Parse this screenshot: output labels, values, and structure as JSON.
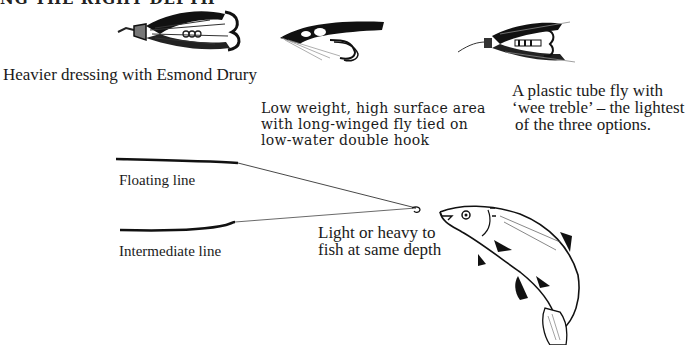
{
  "header": {
    "fragment": "NG THE RIGHT DEPTH"
  },
  "flies": [
    {
      "id": "heavy-dressing-fly",
      "caption": "Heavier dressing with Esmond Drury"
    },
    {
      "id": "long-winged-fly",
      "caption_lines": [
        "Low weight, high surface area",
        "with long-winged fly tied on",
        "low-water double hook"
      ]
    },
    {
      "id": "tube-fly",
      "caption_lines": [
        "A plastic tube fly with",
        "‘wee treble’ – the lightest",
        "of the three options."
      ]
    }
  ],
  "lines": {
    "floating": "Floating line",
    "intermediate": "Intermediate line",
    "note_lines": [
      "Light or heavy to",
      "fish at same depth"
    ]
  },
  "illustrations": {
    "fish": "salmon-leaping"
  }
}
